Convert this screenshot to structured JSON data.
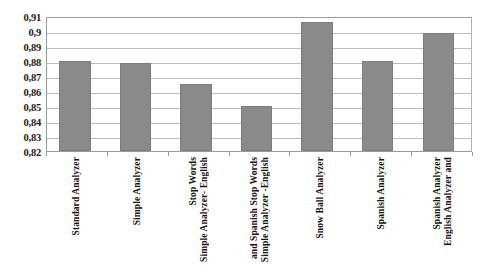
{
  "chart_data": {
    "type": "bar",
    "title": "",
    "subtitle": "",
    "xlabel": "",
    "ylabel": "",
    "ylim": [
      0.82,
      0.91
    ],
    "grid": true,
    "legend": false,
    "orientation": "vertical",
    "decimal_separator": ",",
    "categories": [
      "Standard Analyzer",
      "Simple Analyzer",
      "Simple Analyzer- English Stop Words",
      "Simple Analyzer -English and Spanish Stop Words",
      "Snow Ball Analyzer",
      "Spanish Analyzer",
      "English Analyzer and Spanish Analyzer"
    ],
    "category_label_lines": [
      [
        "Standard Analyzer"
      ],
      [
        "Simple Analyzer"
      ],
      [
        "Simple Analyzer- English",
        "Stop Words"
      ],
      [
        "Simple Analyzer -English",
        "and Spanish Stop Words"
      ],
      [
        "Snow Ball Analyzer"
      ],
      [
        "Spanish Analyzer"
      ],
      [
        "English Analyzer and",
        "Spanish Analyzer"
      ]
    ],
    "values": [
      0.88,
      0.879,
      0.865,
      0.85,
      0.906,
      0.88,
      0.899
    ],
    "ytick_labels": [
      "0,91",
      "0,9",
      "0,89",
      "0,88",
      "0,87",
      "0,86",
      "0,85",
      "0,84",
      "0,83",
      "0,82"
    ],
    "ytick_values": [
      0.91,
      0.9,
      0.89,
      0.88,
      0.87,
      0.86,
      0.85,
      0.84,
      0.83,
      0.82
    ],
    "bar_color": "#8a8a8a",
    "bar_border_color": "#7d7d7d",
    "gridline_color": "#bcbcbc",
    "axis_color": "#9a9a9a",
    "background_color": "#ffffff"
  }
}
